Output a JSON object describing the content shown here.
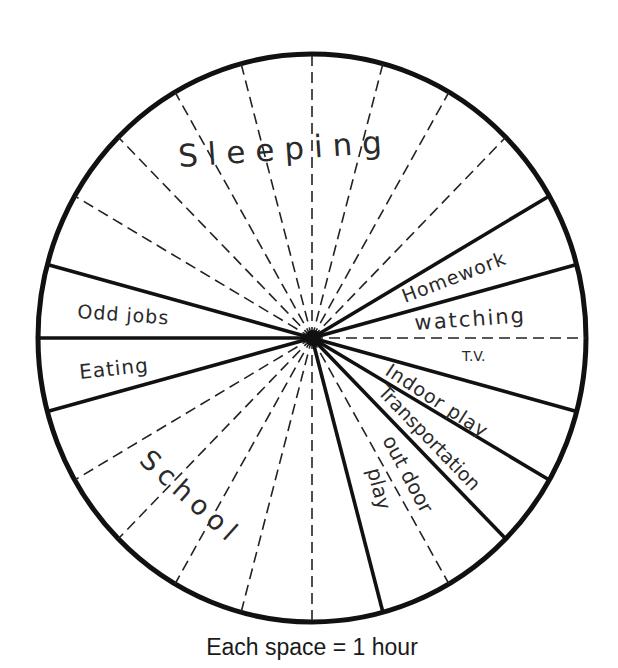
{
  "chart_data": {
    "type": "pie",
    "title": "",
    "caption": "Each space = 1 hour",
    "total_hours": 24,
    "unit": "hour",
    "start_angle_deg": 0,
    "direction": "clockwise",
    "segments": [
      {
        "label": "Sleeping",
        "hours": 9,
        "start_deg": 285,
        "end_deg": 60
      },
      {
        "label": "Homework",
        "hours": 1,
        "start_deg": 60,
        "end_deg": 75
      },
      {
        "label": "watching T.V.",
        "hours": 2,
        "start_deg": 75,
        "end_deg": 105
      },
      {
        "label": "Indoor play",
        "hours": 1,
        "start_deg": 105,
        "end_deg": 120
      },
      {
        "label": "Transportation",
        "hours": 1,
        "start_deg": 120,
        "end_deg": 135
      },
      {
        "label": "out door play",
        "hours": 2,
        "start_deg": 135,
        "end_deg": 165
      },
      {
        "label": "School",
        "hours": 6,
        "start_deg": 165,
        "end_deg": 255
      },
      {
        "label": "Eating",
        "hours": 1,
        "start_deg": 255,
        "end_deg": 270
      },
      {
        "label": "Odd jobs",
        "hours": 1,
        "start_deg": 270,
        "end_deg": 285
      }
    ],
    "categories": [
      "Sleeping",
      "Homework",
      "watching T.V.",
      "Indoor play",
      "Transportation",
      "out door play",
      "School",
      "Eating",
      "Odd jobs"
    ],
    "values": [
      9,
      1,
      2,
      1,
      1,
      2,
      6,
      1,
      1
    ],
    "legend": "none",
    "grid": "hourly dashed dividers (24 spaces)"
  },
  "labels": {
    "sleeping": "Sleeping",
    "homework": "Homework",
    "watching": "watching",
    "tv": "T.V.",
    "indoor_play": "Indoor play",
    "transportation": "Transportation",
    "out_door": "out door",
    "play": "play",
    "school": "School",
    "eating": "Eating",
    "odd_jobs": "Odd jobs"
  },
  "colors": {
    "stroke": "#111111",
    "text": "#2a2a2a",
    "background": "#ffffff"
  }
}
